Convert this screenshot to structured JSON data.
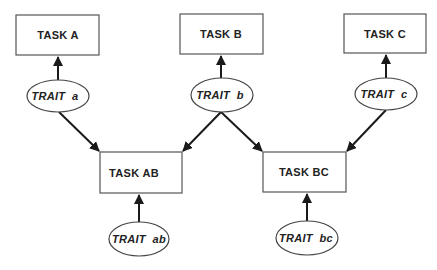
{
  "diagram": {
    "tasks": [
      {
        "id": "task-a",
        "label": "TASK A"
      },
      {
        "id": "task-b",
        "label": "TASK B"
      },
      {
        "id": "task-c",
        "label": "TASK C"
      },
      {
        "id": "task-ab",
        "label": "TASK AB"
      },
      {
        "id": "task-bc",
        "label": "TASK BC"
      }
    ],
    "traits": [
      {
        "id": "trait-a",
        "label": "TRAIT  a"
      },
      {
        "id": "trait-b",
        "label": "TRAIT  b"
      },
      {
        "id": "trait-c",
        "label": "TRAIT  c"
      },
      {
        "id": "trait-ab",
        "label": "TRAIT  ab"
      },
      {
        "id": "trait-bc",
        "label": "TRAIT  bc"
      }
    ],
    "edges": [
      {
        "from": "trait-a",
        "to": "task-a"
      },
      {
        "from": "trait-b",
        "to": "task-b"
      },
      {
        "from": "trait-c",
        "to": "task-c"
      },
      {
        "from": "trait-a",
        "to": "task-ab"
      },
      {
        "from": "trait-b",
        "to": "task-ab"
      },
      {
        "from": "trait-b",
        "to": "task-bc"
      },
      {
        "from": "trait-c",
        "to": "task-bc"
      },
      {
        "from": "trait-ab",
        "to": "task-ab"
      },
      {
        "from": "trait-bc",
        "to": "task-bc"
      }
    ]
  }
}
